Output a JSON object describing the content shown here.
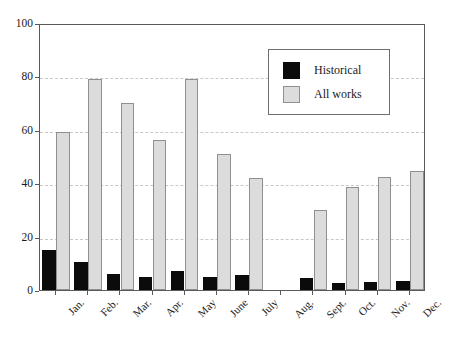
{
  "chart_data": {
    "type": "bar",
    "title": "",
    "subtitle": "",
    "xlabel": "",
    "ylabel": "",
    "ylim": [
      0,
      100
    ],
    "yticks": [
      0,
      20,
      40,
      60,
      80,
      100
    ],
    "ytick_labels": [
      "0",
      "20",
      "40",
      "60",
      "80",
      "100"
    ],
    "grid": true,
    "grid_axis": "y",
    "legend_position": "upper-right",
    "categories": [
      "Jan.",
      "Feb.",
      "Mar.",
      "Apr.",
      "May",
      "June",
      "July",
      "Aug.",
      "Sept.",
      "Oct.",
      "Nov.",
      "Dec."
    ],
    "series": [
      {
        "name": "Historical",
        "color": "#0b0b0b",
        "values": [
          15,
          10.5,
          6,
          5,
          7,
          5,
          5.5,
          0,
          4.5,
          2.5,
          3,
          3.5
        ]
      },
      {
        "name": "All works",
        "color": "#dcdcdc",
        "values": [
          59,
          79,
          70,
          56,
          79,
          51,
          42,
          0,
          30,
          38.5,
          42.5,
          44.5
        ]
      }
    ]
  },
  "legend": {
    "items": [
      {
        "label": "Historical",
        "swatch": "historical"
      },
      {
        "label": "All works",
        "swatch": "allworks"
      }
    ]
  },
  "colors": {
    "historical": "#0b0b0b",
    "all_works_fill": "#dcdcdc",
    "all_works_border": "#8f8f8f",
    "axis": "#5a5a5a",
    "gridline": "#c8c8c8",
    "background": "#ffffff"
  }
}
